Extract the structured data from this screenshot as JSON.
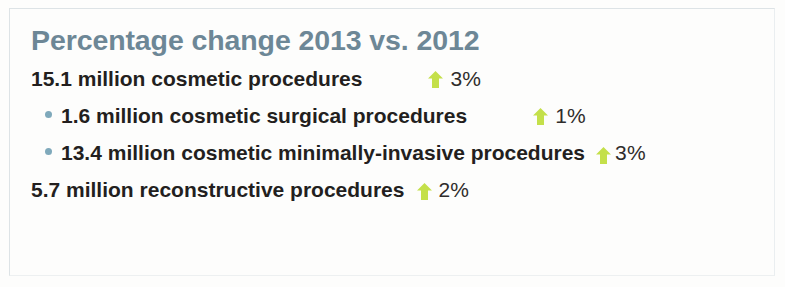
{
  "card": {
    "title": "Percentage change 2013 vs. 2012",
    "background_color": "#fdfdfc",
    "border_color": "#dde3e6",
    "title_color": "#6d8796",
    "text_color": "#231f1e",
    "bullet_color": "#7fa9bb",
    "arrow_color": "#c4e04a"
  },
  "rows": [
    {
      "label": "15.1 million cosmetic procedures",
      "bulleted": false,
      "indent": false,
      "arrow_icon": "arrow-up-icon",
      "direction": "up",
      "percent": "3%"
    },
    {
      "label": "1.6 million cosmetic surgical procedures",
      "bulleted": true,
      "indent": true,
      "arrow_icon": "arrow-up-icon",
      "direction": "up",
      "percent": "1%"
    },
    {
      "label": "13.4 million cosmetic minimally-invasive procedures",
      "bulleted": true,
      "indent": true,
      "arrow_icon": "arrow-up-icon",
      "direction": "up",
      "percent": "3%"
    },
    {
      "label": "5.7 million reconstructive procedures",
      "bulleted": false,
      "indent": false,
      "arrow_icon": "arrow-up-icon",
      "direction": "up",
      "percent": "2%"
    }
  ]
}
